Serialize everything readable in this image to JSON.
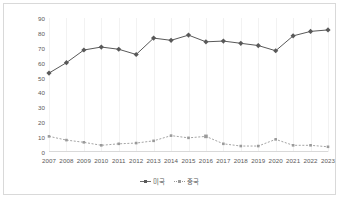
{
  "chart_data": {
    "type": "line",
    "title": "",
    "xlabel": "",
    "ylabel": "",
    "ylim": [
      0,
      90
    ],
    "yticks": [
      0,
      10,
      20,
      30,
      40,
      50,
      60,
      70,
      80,
      90
    ],
    "grid": "vertical",
    "legend_position": "bottom",
    "categories": [
      "2007",
      "2008",
      "2009",
      "2010",
      "2011",
      "2012",
      "2013",
      "2014",
      "2015",
      "2016",
      "2017",
      "2018",
      "2019",
      "2020",
      "2021",
      "2022",
      "2023"
    ],
    "series": [
      {
        "name": "미국",
        "color": "#595959",
        "line_style": "solid",
        "marker": "diamond",
        "values": [
          53,
          60,
          68.5,
          70.5,
          69,
          65.5,
          76.5,
          75,
          78.5,
          74,
          74.5,
          73,
          71.5,
          68,
          78,
          81,
          82
        ]
      },
      {
        "name": "중국",
        "color": "#9a9a9a",
        "line_style": "dotted",
        "marker": "square",
        "values": [
          10.5,
          8,
          6.5,
          4.5,
          5.5,
          6,
          7.5,
          11,
          9.5,
          10.5,
          5.5,
          4,
          4,
          8.5,
          4.5,
          4.5,
          3.5
        ]
      }
    ]
  }
}
